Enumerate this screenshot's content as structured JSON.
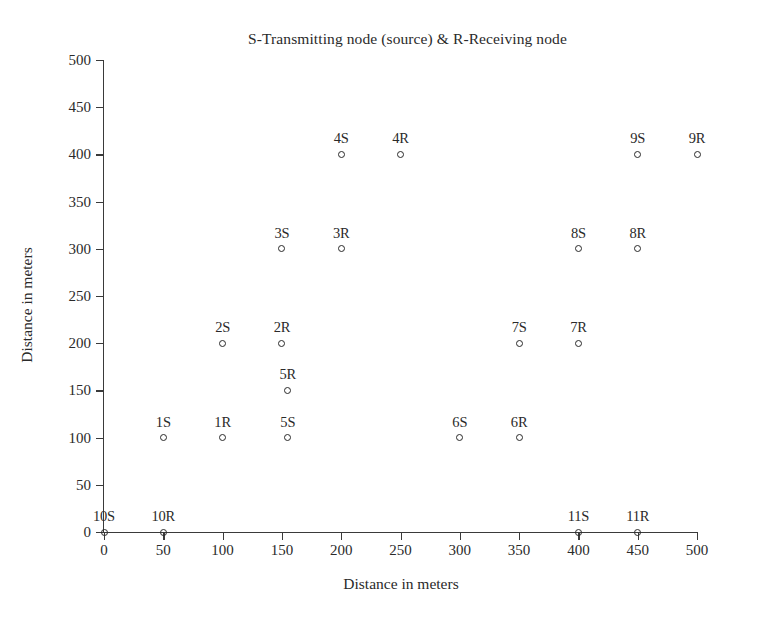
{
  "chart_data": {
    "type": "scatter",
    "title": "S-Transmitting node (source) & R-Receiving node",
    "xlabel": "Distance in meters",
    "ylabel": "Distance in meters",
    "xlim": [
      0,
      500
    ],
    "ylim": [
      0,
      500
    ],
    "xticks": [
      0,
      50,
      100,
      150,
      200,
      250,
      300,
      350,
      400,
      450,
      500
    ],
    "yticks": [
      0,
      50,
      100,
      150,
      200,
      250,
      300,
      350,
      400,
      450,
      500
    ],
    "grid": false,
    "legend": null,
    "marker": "open-circle",
    "marker_color": "#2a2a2a",
    "points": [
      {
        "label": "1S",
        "x": 50,
        "y": 100
      },
      {
        "label": "1R",
        "x": 100,
        "y": 100
      },
      {
        "label": "2S",
        "x": 100,
        "y": 200
      },
      {
        "label": "2R",
        "x": 150,
        "y": 200
      },
      {
        "label": "3S",
        "x": 150,
        "y": 300
      },
      {
        "label": "3R",
        "x": 200,
        "y": 300
      },
      {
        "label": "4S",
        "x": 200,
        "y": 400
      },
      {
        "label": "4R",
        "x": 250,
        "y": 400
      },
      {
        "label": "5S",
        "x": 155,
        "y": 100
      },
      {
        "label": "5R",
        "x": 155,
        "y": 150
      },
      {
        "label": "6S",
        "x": 300,
        "y": 100
      },
      {
        "label": "6R",
        "x": 350,
        "y": 100
      },
      {
        "label": "7S",
        "x": 350,
        "y": 200
      },
      {
        "label": "7R",
        "x": 400,
        "y": 200
      },
      {
        "label": "8S",
        "x": 400,
        "y": 300
      },
      {
        "label": "8R",
        "x": 450,
        "y": 300
      },
      {
        "label": "9S",
        "x": 450,
        "y": 400
      },
      {
        "label": "9R",
        "x": 500,
        "y": 400
      },
      {
        "label": "10S",
        "x": 0,
        "y": 0
      },
      {
        "label": "10R",
        "x": 50,
        "y": 0
      },
      {
        "label": "11S",
        "x": 400,
        "y": 0
      },
      {
        "label": "11R",
        "x": 450,
        "y": 0
      }
    ]
  }
}
